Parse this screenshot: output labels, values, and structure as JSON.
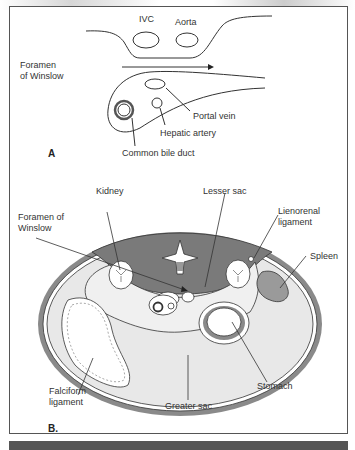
{
  "figure": {
    "panel_a": {
      "label": "A",
      "structures": {
        "ivc": "IVC",
        "aorta": "Aorta",
        "foramen_line1": "Foramen",
        "foramen_line2": "of Winslow",
        "portal_vein": "Portal vein",
        "hepatic_artery": "Hepatic artery",
        "common_bile_duct": "Common bile duct"
      }
    },
    "panel_b": {
      "label": "B.",
      "structures": {
        "kidney": "Kidney",
        "lesser_sac": "Lesser sac",
        "foramen_line1": "Foramen of",
        "foramen_line2": "Winslow",
        "lienorenal_line1": "Lienorenal",
        "lienorenal_line2": "ligament",
        "spleen": "Spleen",
        "stomach": "Stomach",
        "falciform_line1": "Falciform",
        "falciform_line2": "ligament",
        "greater_sac": "Greater sac"
      }
    },
    "colors": {
      "dark_fill": "#7a7a7a",
      "light_fill": "#e8e8e8",
      "line": "#333333",
      "spleen_fill": "#9a9a9a"
    }
  }
}
